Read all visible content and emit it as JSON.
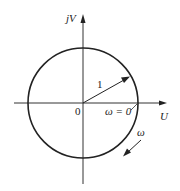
{
  "diagram": {
    "type": "nyquist-unit-circle",
    "axes": {
      "vertical_label": "jV",
      "horizontal_label": "U",
      "origin_label": "0"
    },
    "circle": {
      "center": [
        83,
        103
      ],
      "radius": 55
    },
    "vector": {
      "label": "1",
      "angle_deg": 30
    },
    "annotations": {
      "start_point_label": "ω = 0",
      "direction_label": "ω"
    },
    "colors": {
      "stroke": "#222222",
      "background": "#ffffff"
    }
  }
}
